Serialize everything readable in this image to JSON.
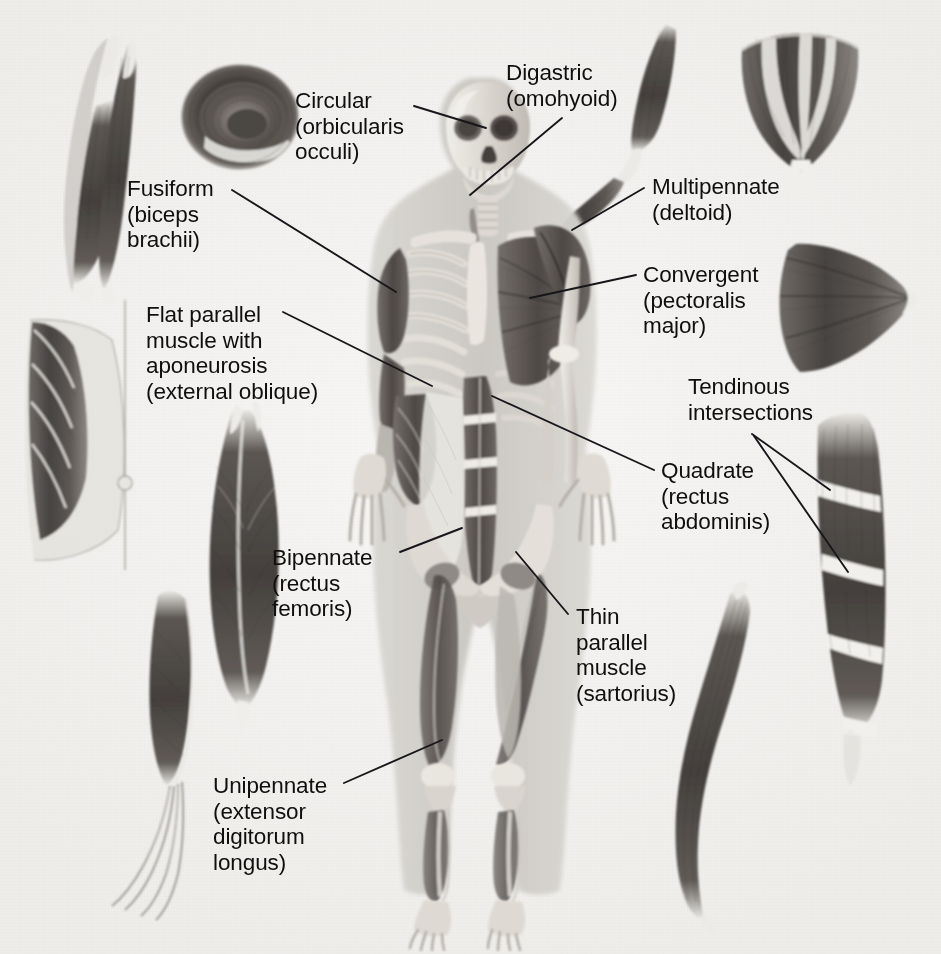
{
  "figure": {
    "background_color": "#f3f2f0",
    "text_color": "#100f0e",
    "leader_line_color": "#17161a",
    "width": 941,
    "height": 954
  },
  "labels": [
    {
      "id": "circular",
      "name": "Circular",
      "parenthetical": "(orbicularis\nocculi)",
      "full_text": "Circular\n(orbicularis\nocculi)",
      "x": 295,
      "y": 88,
      "align": "left"
    },
    {
      "id": "digastric",
      "name": "Digastric",
      "parenthetical": "(omohyoid)",
      "full_text": "Digastric\n(omohyoid)",
      "x": 506,
      "y": 60,
      "align": "left"
    },
    {
      "id": "fusiform",
      "name": "Fusiform",
      "parenthetical": "(biceps\nbrachii)",
      "full_text": "Fusiform\n(biceps\nbrachii)",
      "x": 127,
      "y": 176,
      "align": "left"
    },
    {
      "id": "multipennate",
      "name": "Multipennate",
      "parenthetical": "(deltoid)",
      "full_text": "Multipennate\n(deltoid)",
      "x": 652,
      "y": 174,
      "align": "left"
    },
    {
      "id": "convergent",
      "name": "Convergent",
      "parenthetical": "(pectoralis\nmajor)",
      "full_text": "Convergent\n(pectoralis\nmajor)",
      "x": 643,
      "y": 262,
      "align": "left"
    },
    {
      "id": "flat-parallel",
      "name": "Flat parallel muscle with aponeurosis",
      "parenthetical": "(external oblique)",
      "full_text": "Flat parallel\nmuscle with\naponeurosis\n(external oblique)",
      "x": 146,
      "y": 302,
      "align": "left"
    },
    {
      "id": "tendinous-intersections",
      "name": "Tendinous intersections",
      "parenthetical": "",
      "full_text": "Tendinous\nintersections",
      "x": 688,
      "y": 374,
      "align": "left"
    },
    {
      "id": "quadrate",
      "name": "Quadrate",
      "parenthetical": "(rectus\nabdominis)",
      "full_text": "Quadrate\n(rectus\nabdominis)",
      "x": 661,
      "y": 458,
      "align": "left"
    },
    {
      "id": "bipennate",
      "name": "Bipennate",
      "parenthetical": "(rectus\nfemoris)",
      "full_text": "Bipennate\n(rectus\nfemoris)",
      "x": 272,
      "y": 545,
      "align": "left"
    },
    {
      "id": "thin-parallel",
      "name": "Thin parallel muscle",
      "parenthetical": "(sartorius)",
      "full_text": "Thin\nparallel\nmuscle\n(sartorius)",
      "x": 576,
      "y": 604,
      "align": "left"
    },
    {
      "id": "unipennate",
      "name": "Unipennate",
      "parenthetical": "(extensor\ndigitorum\nlongus)",
      "full_text": "Unipennate\n(extensor\ndigitorum\nlongus)",
      "x": 213,
      "y": 773,
      "align": "left"
    }
  ],
  "leader_lines": [
    {
      "id": "leader-circular",
      "from_label": "circular",
      "d": "M 414 106 L 486 128"
    },
    {
      "id": "leader-digastric",
      "from_label": "digastric",
      "d": "M 562 118 L 470 195"
    },
    {
      "id": "leader-fusiform",
      "from_label": "fusiform",
      "d": "M 232 190 L 396 292"
    },
    {
      "id": "leader-multipennate",
      "from_label": "multipennate",
      "d": "M 644 188 L 572 230"
    },
    {
      "id": "leader-convergent",
      "from_label": "convergent",
      "d": "M 636 275 L 530 298"
    },
    {
      "id": "leader-flat-parallel",
      "from_label": "flat-parallel",
      "d": "M 283 312 L 432 386"
    },
    {
      "id": "leader-tendinous-1",
      "from_label": "tendinous-intersections",
      "d": "M 752 434 L 830 490"
    },
    {
      "id": "leader-tendinous-2",
      "from_label": "tendinous-intersections",
      "d": "M 754 436 L 848 572"
    },
    {
      "id": "leader-quadrate",
      "from_label": "quadrate",
      "d": "M 654 470 L 492 396"
    },
    {
      "id": "leader-bipennate",
      "from_label": "bipennate",
      "d": "M 400 552 L 462 528"
    },
    {
      "id": "leader-thin-parallel",
      "from_label": "thin-parallel",
      "d": "M 568 614 L 516 552"
    },
    {
      "id": "leader-unipennate",
      "from_label": "unipennate",
      "d": "M 344 783 L 442 740"
    }
  ],
  "illustrations": [
    {
      "id": "fusiform-muscle",
      "label_ref": "fusiform",
      "description": "spindle-shaped muscle with tapering tendons at both ends"
    },
    {
      "id": "circular-muscle",
      "label_ref": "circular",
      "description": "ring of concentric muscle fibres"
    },
    {
      "id": "digastric-muscle",
      "label_ref": "digastric",
      "description": "two bellies joined by an intermediate tendon"
    },
    {
      "id": "multipennate-muscle",
      "label_ref": "multipennate",
      "description": "fan with several feathered tendon columns converging to one tendon"
    },
    {
      "id": "convergent-muscle",
      "label_ref": "convergent",
      "description": "broad triangular fan converging to a single point"
    },
    {
      "id": "flat-parallel-muscle",
      "label_ref": "flat-parallel",
      "description": "flat sheet of oblique fibres ending in a broad aponeurosis"
    },
    {
      "id": "bipennate-muscle",
      "label_ref": "bipennate",
      "description": "central tendon with fibres angling in from both sides"
    },
    {
      "id": "unipennate-muscle",
      "label_ref": "unipennate",
      "description": "fibres on one side of a long tendon splitting into four slips"
    },
    {
      "id": "quadrate-muscle",
      "label_ref": "quadrate",
      "description": "strap muscle crossed by pale tendinous bands"
    },
    {
      "id": "thin-parallel-muscle",
      "label_ref": "thin-parallel",
      "description": "long narrow ribbon-like strap muscle"
    },
    {
      "id": "body-figure",
      "label_ref": "",
      "description": "anterior view of human skeleton with superficial muscles on the subject's right side"
    }
  ]
}
